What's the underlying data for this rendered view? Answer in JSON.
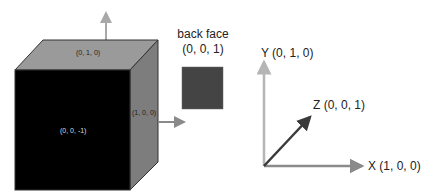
{
  "cube": {
    "top_face_label": "(0, 1, 0)",
    "front_face_label": "(0, 0, -1)",
    "right_face_label": "(1, 0, 0)",
    "colors": {
      "front": "#000000",
      "top": "#9a9a9a",
      "right": "#7d7d7d",
      "edge": "#333333",
      "normal_arrow": "#a8a8a8"
    }
  },
  "back_face": {
    "title": "back face",
    "label": "(0, 0, 1)",
    "color": "#444444"
  },
  "axes": {
    "y_label": "Y  (0, 1, 0)",
    "z_label": "Z (0, 0, 1)",
    "x_label": "X (1, 0, 0)",
    "colors": {
      "y": "#b5b5b5",
      "z": "#3a3a3a",
      "x": "#8a8a8a"
    }
  }
}
